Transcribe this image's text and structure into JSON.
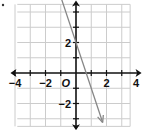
{
  "chart_data": {
    "type": "line",
    "title": "",
    "xlabel": "",
    "ylabel": "",
    "xlim": [
      -4,
      4
    ],
    "ylim": [
      -3.5,
      4.5
    ],
    "grid": true,
    "x_ticks": [
      {
        "value": -4,
        "label": "−4"
      },
      {
        "value": -2,
        "label": "−2"
      },
      {
        "value": 2,
        "label": "2"
      },
      {
        "value": 4,
        "label": "4"
      }
    ],
    "y_ticks": [
      {
        "value": 2,
        "label": "2"
      },
      {
        "value": -2,
        "label": "−2"
      }
    ],
    "origin_label": "O",
    "series": [
      {
        "name": "line",
        "equation": "y = -3x + 2",
        "x": [
          -1.1,
          1.75
        ],
        "y": [
          5.3,
          -3.25
        ],
        "arrows": "both",
        "color": "#888888"
      }
    ],
    "axis_color": "#111111",
    "grid_color": "#cccccc"
  }
}
